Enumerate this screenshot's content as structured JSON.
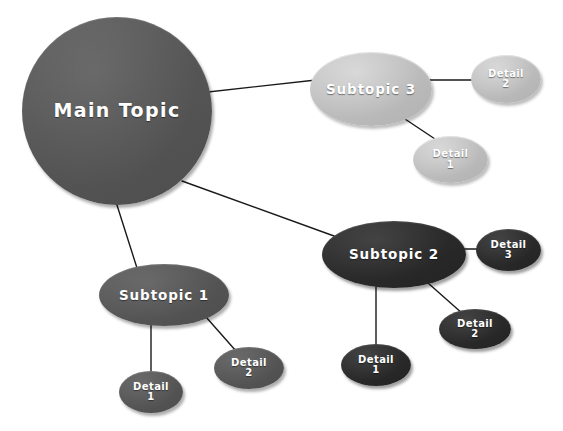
{
  "diagram": {
    "background_color": "#ffffff",
    "edge_color": "#1a1a1a",
    "palette": {
      "root": "#565656",
      "branch_mid": "#5f5f5f",
      "branch_light": "#bdbdbd",
      "branch_dark": "#2b2b2b",
      "label": "#ffffff"
    }
  },
  "nodes": [
    {
      "id": "root",
      "label": "Main Topic",
      "tone": "tone-mid",
      "size": "root-node",
      "name": "node-main-topic",
      "x": 22,
      "y": 17,
      "w": 190,
      "h": 188
    },
    {
      "id": "sub3",
      "label": "Subtopic 3",
      "tone": "tone-light",
      "size": "subtopic-node",
      "name": "node-subtopic-3",
      "x": 310,
      "y": 52,
      "w": 122,
      "h": 74
    },
    {
      "id": "sub3_d2",
      "label": "Detail\n2",
      "tone": "tone-light",
      "size": "detail-node",
      "name": "node-subtopic-3-detail-2",
      "x": 471,
      "y": 55,
      "w": 70,
      "h": 48
    },
    {
      "id": "sub3_d1",
      "label": "Detail\n1",
      "tone": "tone-light",
      "size": "detail-node",
      "name": "node-subtopic-3-detail-1",
      "x": 413,
      "y": 136,
      "w": 75,
      "h": 47
    },
    {
      "id": "sub2",
      "label": "Subtopic 2",
      "tone": "tone-dark",
      "size": "subtopic-node",
      "name": "node-subtopic-2",
      "x": 322,
      "y": 221,
      "w": 144,
      "h": 67
    },
    {
      "id": "sub2_d3",
      "label": "Detail\n3",
      "tone": "tone-dark",
      "size": "detail-node",
      "name": "node-subtopic-2-detail-3",
      "x": 476,
      "y": 229,
      "w": 65,
      "h": 42
    },
    {
      "id": "sub2_d2",
      "label": "Detail\n2",
      "tone": "tone-dark",
      "size": "detail-node",
      "name": "node-subtopic-2-detail-2",
      "x": 439,
      "y": 309,
      "w": 72,
      "h": 40
    },
    {
      "id": "sub2_d1",
      "label": "Detail\n1",
      "tone": "tone-dark",
      "size": "detail-node",
      "name": "node-subtopic-2-detail-1",
      "x": 341,
      "y": 344,
      "w": 70,
      "h": 42
    },
    {
      "id": "sub1",
      "label": "Subtopic 1",
      "tone": "tone-mid",
      "size": "subtopic-node",
      "name": "node-subtopic-1",
      "x": 99,
      "y": 264,
      "w": 130,
      "h": 62
    },
    {
      "id": "sub1_d2",
      "label": "Detail\n2",
      "tone": "tone-mid",
      "size": "detail-node",
      "name": "node-subtopic-1-detail-2",
      "x": 214,
      "y": 347,
      "w": 70,
      "h": 42
    },
    {
      "id": "sub1_d1",
      "label": "Detail\n1",
      "tone": "tone-mid",
      "size": "detail-node",
      "name": "node-subtopic-1-detail-1",
      "x": 119,
      "y": 371,
      "w": 64,
      "h": 42
    }
  ],
  "edges": [
    {
      "name": "edge-root-to-subtopic-3",
      "from": "root",
      "to": "sub3",
      "x1": 208,
      "y1": 92,
      "x2": 316,
      "y2": 80
    },
    {
      "name": "edge-root-to-subtopic-2",
      "from": "root",
      "to": "sub2",
      "x1": 182,
      "y1": 181,
      "x2": 334,
      "y2": 236
    },
    {
      "name": "edge-root-to-subtopic-1",
      "from": "root",
      "to": "sub1",
      "x1": 116,
      "y1": 202,
      "x2": 137,
      "y2": 268
    },
    {
      "name": "edge-subtopic-3-to-detail-2",
      "from": "sub3",
      "to": "sub3_d2",
      "x1": 429,
      "y1": 80,
      "x2": 474,
      "y2": 80
    },
    {
      "name": "edge-subtopic-3-to-detail-1",
      "from": "sub3",
      "to": "sub3_d1",
      "x1": 405,
      "y1": 119,
      "x2": 441,
      "y2": 143
    },
    {
      "name": "edge-subtopic-2-to-detail-3",
      "from": "sub2",
      "to": "sub2_d3",
      "x1": 462,
      "y1": 249,
      "x2": 480,
      "y2": 249
    },
    {
      "name": "edge-subtopic-2-to-detail-2",
      "from": "sub2",
      "to": "sub2_d2",
      "x1": 428,
      "y1": 283,
      "x2": 463,
      "y2": 314
    },
    {
      "name": "edge-subtopic-2-to-detail-1",
      "from": "sub2",
      "to": "sub2_d1",
      "x1": 376,
      "y1": 287,
      "x2": 376,
      "y2": 348
    },
    {
      "name": "edge-subtopic-1-to-detail-2",
      "from": "sub1",
      "to": "sub1_d2",
      "x1": 206,
      "y1": 317,
      "x2": 236,
      "y2": 351
    },
    {
      "name": "edge-subtopic-1-to-detail-1",
      "from": "sub1",
      "to": "sub1_d1",
      "x1": 151,
      "y1": 325,
      "x2": 151,
      "y2": 375
    }
  ]
}
